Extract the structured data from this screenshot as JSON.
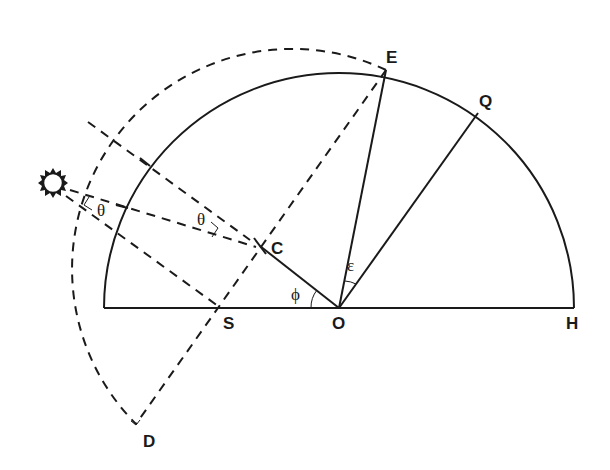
{
  "diagram": {
    "title": "",
    "colors": {
      "stroke": "#1a1a1a",
      "background": "#ffffff"
    },
    "points": {
      "E": {
        "label": "E"
      },
      "Q": {
        "label": "Q"
      },
      "C": {
        "label": "C"
      },
      "S": {
        "label": "S"
      },
      "O": {
        "label": "O"
      },
      "H": {
        "label": "H"
      },
      "D": {
        "label": "D"
      }
    },
    "angles": {
      "theta_1": "θ",
      "theta_2": "θ",
      "phi": "ϕ",
      "epsilon": "ε"
    },
    "icons": {
      "sun": "sun-icon"
    }
  }
}
